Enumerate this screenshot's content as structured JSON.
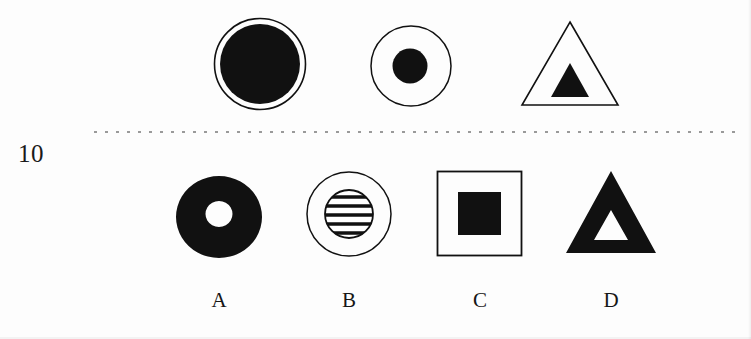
{
  "question": {
    "number": "10",
    "type": "nonverbal-reasoning-analogy"
  },
  "colors": {
    "ink": "#111111",
    "fill": "#111111",
    "paper": "#fdfdfd",
    "rule": "#9a9a9a",
    "hole": "#ffffff"
  },
  "separator": {
    "style": "dotted",
    "x_start": 94,
    "x_end": 742,
    "y": 131
  },
  "stimulus": {
    "label": "stimulus-row",
    "items": [
      {
        "id": "stimulus-1",
        "name": "filled-circle-in-ring",
        "outer_shape": "circle",
        "outer_style": "outline",
        "inner_shape": "circle",
        "inner_style": "filled",
        "inner_ratio": 0.86,
        "cx": 260,
        "cy": 64,
        "r": 46
      },
      {
        "id": "stimulus-2",
        "name": "small-filled-circle-in-circle",
        "outer_shape": "circle",
        "outer_style": "outline",
        "inner_shape": "circle",
        "inner_style": "filled",
        "inner_ratio": 0.44,
        "cx": 410,
        "cy": 65,
        "r": 39
      },
      {
        "id": "stimulus-3",
        "name": "filled-triangle-in-triangle",
        "outer_shape": "triangle",
        "outer_style": "outline",
        "inner_shape": "triangle",
        "inner_style": "filled",
        "inner_ratio": 0.33,
        "cx": 570,
        "cy": 64,
        "r": 48
      }
    ]
  },
  "options": {
    "label": "answer-options-row",
    "items": [
      {
        "id": "option-a",
        "letter": "A",
        "name": "black-annulus",
        "outer_shape": "circle",
        "outer_style": "filled",
        "inner_shape": "circle",
        "inner_style": "hole",
        "inner_ratio": 0.3,
        "cx": 219,
        "cy": 74,
        "r": 44
      },
      {
        "id": "option-b",
        "letter": "B",
        "name": "striped-circle-in-circle",
        "outer_shape": "circle",
        "outer_style": "outline",
        "inner_shape": "circle",
        "inner_style": "striped",
        "inner_ratio": 0.56,
        "stripes": 5,
        "cx": 348,
        "cy": 72,
        "r": 42
      },
      {
        "id": "option-c",
        "letter": "C",
        "name": "filled-square-in-square",
        "outer_shape": "square",
        "outer_style": "outline",
        "inner_shape": "square",
        "inner_style": "filled",
        "inner_ratio": 0.5,
        "cx": 479,
        "cy": 73,
        "r": 42
      },
      {
        "id": "option-d",
        "letter": "D",
        "name": "triangle-hole-in-filled-triangle",
        "outer_shape": "triangle",
        "outer_style": "filled",
        "inner_shape": "triangle",
        "inner_style": "hole",
        "inner_ratio": 0.33,
        "cx": 610,
        "cy": 73,
        "r": 47
      }
    ]
  }
}
